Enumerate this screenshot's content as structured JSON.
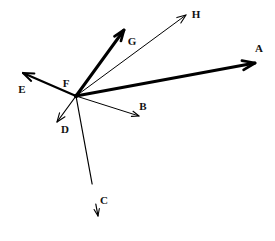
{
  "figure": {
    "type": "ray-diagram",
    "width": 275,
    "height": 241,
    "background_color": "#ffffff",
    "stroke_color": "#000000",
    "label_color": "#111111"
  },
  "vertex": {
    "name": "F",
    "label": "F",
    "x": 76,
    "y": 96,
    "label_x": 66,
    "label_y": 83
  },
  "rays": [
    {
      "id": "ray-a",
      "label": "A",
      "from_x": 76,
      "from_y": 96,
      "to_x": 255,
      "to_y": 63,
      "thickness": 3.0,
      "arrow_size": 7,
      "label_x": 259,
      "label_y": 48,
      "weight": "thick"
    },
    {
      "id": "ray-b",
      "label": "B",
      "from_x": 76,
      "from_y": 96,
      "to_x": 139,
      "to_y": 116,
      "thickness": 1.0,
      "arrow_size": 4,
      "label_x": 143,
      "label_y": 106,
      "weight": "thin"
    },
    {
      "id": "ray-c",
      "label": "C",
      "from_x": 76,
      "from_y": 96,
      "to_x": 98,
      "to_y": 216,
      "thickness": 1.2,
      "arrow_size": 4,
      "label_x": 104,
      "label_y": 200,
      "weight": "thin",
      "gap": true,
      "gap_start": 184,
      "gap_end": 204
    },
    {
      "id": "ray-d",
      "label": "D",
      "from_x": 76,
      "from_y": 96,
      "to_x": 57,
      "to_y": 122,
      "thickness": 1.2,
      "arrow_size": 5,
      "label_x": 65,
      "label_y": 129,
      "weight": "thin"
    },
    {
      "id": "ray-e",
      "label": "E",
      "from_x": 76,
      "from_y": 96,
      "to_x": 23,
      "to_y": 73,
      "thickness": 2.2,
      "arrow_size": 6,
      "label_x": 22,
      "label_y": 89,
      "weight": "medium"
    },
    {
      "id": "ray-g",
      "label": "G",
      "from_x": 76,
      "from_y": 96,
      "to_x": 124,
      "to_y": 30,
      "thickness": 3.0,
      "arrow_size": 6,
      "label_x": 132,
      "label_y": 41,
      "weight": "thick"
    },
    {
      "id": "ray-h",
      "label": "H",
      "from_x": 76,
      "from_y": 96,
      "to_x": 186,
      "to_y": 15,
      "thickness": 1.0,
      "arrow_size": 5,
      "label_x": 196,
      "label_y": 14,
      "weight": "thin"
    }
  ]
}
